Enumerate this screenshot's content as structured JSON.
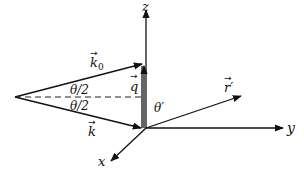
{
  "diagram": {
    "type": "scattering-vector-geometry",
    "axes": {
      "z_label": "z",
      "y_label": "y",
      "x_label": "x"
    },
    "vectors": {
      "k0_label": "k",
      "k0_subscript": "0",
      "k_label": "k",
      "q_label": "q",
      "r_label": "r",
      "r_prime": "′"
    },
    "angles": {
      "half_theta_upper": "θ/2",
      "half_theta_lower": "θ/2",
      "theta_prime": "θ′"
    },
    "arrow_symbol": "→",
    "colors": {
      "ink": "#111111",
      "background": "#ffffff"
    }
  }
}
